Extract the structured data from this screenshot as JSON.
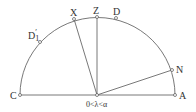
{
  "diagram": {
    "type": "semicircle geometry",
    "stroke_color": "#555555",
    "center_label": "0<λ<α",
    "points": {
      "C": {
        "label": "C"
      },
      "A": {
        "label": "A"
      },
      "Z": {
        "label": "Z"
      },
      "X": {
        "label": "X"
      },
      "D": {
        "label": "D"
      },
      "D1p": {
        "label": "D",
        "sub": "1",
        "prime": "′"
      },
      "N": {
        "label": "N"
      }
    }
  }
}
